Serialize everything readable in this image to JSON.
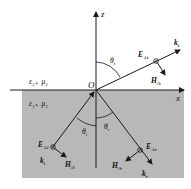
{
  "diagram": {
    "type": "EM wave reflection and refraction at interface (perpendicular polarization)",
    "axes": {
      "z_label": "z",
      "x_label": "x",
      "origin_label": "O"
    },
    "media": {
      "upper": {
        "eps": "ε₂",
        "mu": "μ₂",
        "label": "ε₂、μ₂"
      },
      "lower": {
        "eps": "ε₁",
        "mu": "μ₁",
        "label": "ε₁、μ₁"
      }
    },
    "waves": {
      "incident": {
        "E": "E",
        "E_sub": "⊥i",
        "H": "H",
        "H_sub": "//i",
        "k": "k",
        "k_sub": "i",
        "angle": "θ",
        "angle_sub": "i"
      },
      "reflected": {
        "E": "E",
        "E_sub": "⊥r",
        "H": "H",
        "H_sub": "//r",
        "k": "k",
        "k_sub": "r",
        "angle": "θ",
        "angle_sub": "r"
      },
      "transmitted": {
        "E": "E",
        "E_sub": "⊥t",
        "H": "H",
        "H_sub": "//t",
        "k": "k",
        "k_sub": "t",
        "angle": "θ",
        "angle_sub": "t"
      }
    },
    "colors": {
      "lower_medium": "#b8b8b8",
      "line": "#1a1a1a",
      "background": "#ffffff"
    }
  }
}
